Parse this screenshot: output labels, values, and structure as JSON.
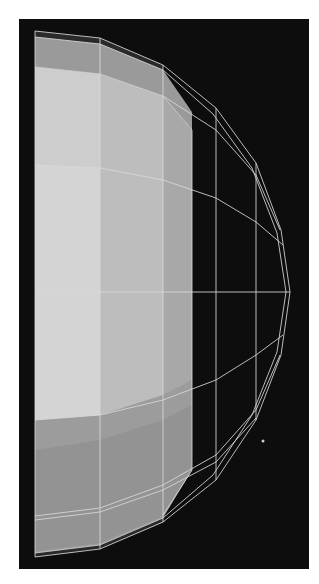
{
  "figure": {
    "caption": "Wireframe half-sphere rendering",
    "background_color": "#0d0d0d",
    "wire_color": "#d8d8d8",
    "face_colors": {
      "front_light": "#cfcfcf",
      "front_mid": "#b9b9b9",
      "side": "#a4a4a4",
      "band_top": "#9a9a9a",
      "band_bottom": "#8f8f8f",
      "rim_dark": "#2a2a2a"
    }
  }
}
